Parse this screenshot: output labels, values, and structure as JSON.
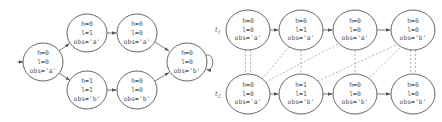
{
  "left_diagram": {
    "title": "State transition system",
    "nodes": [
      {
        "id": "s0",
        "cx": 43,
        "cy": 62,
        "lines": [
          "h=0",
          "l=0",
          "obs='a'"
        ]
      },
      {
        "id": "s1",
        "cx": 87,
        "cy": 33,
        "lines": [
          "h=0",
          "l=1",
          "obs='a'"
        ]
      },
      {
        "id": "s2",
        "cx": 137,
        "cy": 33,
        "lines": [
          "h=0",
          "l=0",
          "obs='a'"
        ]
      },
      {
        "id": "s3",
        "cx": 87,
        "cy": 90,
        "lines": [
          "h=1",
          "l=1",
          "obs='b'"
        ]
      },
      {
        "id": "s4",
        "cx": 137,
        "cy": 90,
        "lines": [
          "h=0",
          "l=0",
          "obs='b'"
        ]
      },
      {
        "id": "s5",
        "cx": 187,
        "cy": 62,
        "lines": [
          "h=0",
          "l=0",
          "obs='b'"
        ]
      }
    ],
    "edges": [
      {
        "from": "start",
        "to": "s0"
      },
      {
        "from": "s0",
        "to": "s1"
      },
      {
        "from": "s1",
        "to": "s2"
      },
      {
        "from": "s2",
        "to": "s5"
      },
      {
        "from": "s0",
        "to": "s3"
      },
      {
        "from": "s3",
        "to": "s4"
      },
      {
        "from": "s4",
        "to": "s5"
      },
      {
        "from": "s5",
        "to": "s5",
        "type": "self-loop"
      }
    ]
  },
  "right_diagram": {
    "traces": [
      {
        "label": "t",
        "subscript": "1",
        "nodes": [
          {
            "lines": [
              "h=0",
              "l=0",
              "obs='a'"
            ]
          },
          {
            "lines": [
              "h=0",
              "l=1",
              "obs='a'"
            ]
          },
          {
            "lines": [
              "h=0",
              "l=0",
              "obs='a'"
            ]
          },
          {
            "lines": [
              "h=0",
              "l=0",
              "obs='b'"
            ]
          }
        ]
      },
      {
        "label": "t",
        "subscript": "2",
        "nodes": [
          {
            "lines": [
              "h=0",
              "l=0",
              "obs='a'"
            ]
          },
          {
            "lines": [
              "h=1",
              "l=1",
              "obs='b'"
            ]
          },
          {
            "lines": [
              "h=0",
              "l=0",
              "obs='b'"
            ]
          },
          {
            "lines": [
              "h=0",
              "l=0",
              "obs='b'"
            ]
          }
        ]
      }
    ],
    "correspondences": [
      {
        "from_t1": 0,
        "to_t2": 0,
        "style": "double"
      },
      {
        "from_t1": 1,
        "to_t2": 0,
        "style": "single"
      },
      {
        "from_t1": 2,
        "to_t2": 0,
        "style": "single"
      },
      {
        "from_t1": 1,
        "to_t2": 1,
        "style": "single"
      },
      {
        "from_t1": 3,
        "to_t2": 1,
        "style": "single"
      },
      {
        "from_t1": 2,
        "to_t2": 2,
        "style": "single"
      },
      {
        "from_t1": 3,
        "to_t2": 2,
        "style": "single"
      },
      {
        "from_t1": 3,
        "to_t2": 3,
        "style": "double"
      }
    ]
  },
  "colors": {
    "node_stroke": "#555555",
    "edge": "#555555",
    "dashed": "#9a9a9a",
    "text": "#555555"
  }
}
